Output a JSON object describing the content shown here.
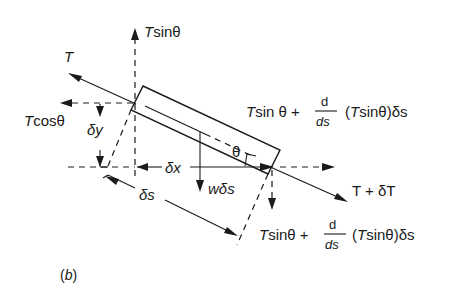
{
  "figure": {
    "panel_label": "(b)",
    "labels": {
      "tension_left": "T",
      "vertical_top": "Tsinθ",
      "horizontal_left": "Tcosθ",
      "dy": "δy",
      "dx": "δx",
      "ds": "δs",
      "weight": "wδs",
      "angle": "θ",
      "tension_right": "T + δT",
      "upper_right_expr": {
        "term1": "Tsin θ +",
        "frac_num": "d",
        "frac_den": "ds",
        "term2": "(Tsinθ)δs"
      },
      "lower_right_expr": {
        "term1": "Tsinθ +",
        "frac_num": "d",
        "frac_den": "ds",
        "term2": "(Tsinθ)δs"
      }
    },
    "colors": {
      "ink": "#1a1a1a",
      "background": "#ffffff"
    }
  }
}
